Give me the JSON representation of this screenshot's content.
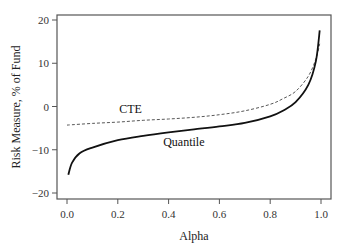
{
  "chart_data": {
    "type": "line",
    "title": "",
    "xlabel": "Alpha",
    "ylabel": "Risk Measure, % of Fund",
    "xlim": [
      0.0,
      1.0
    ],
    "ylim": [
      -20,
      20
    ],
    "xticks": [
      "0.0",
      "0.2",
      "0.4",
      "0.6",
      "0.8",
      "1.0"
    ],
    "yticks": [
      "-20",
      "-10",
      "0",
      "10",
      "20"
    ],
    "grid": false,
    "legend": "inline labels",
    "series": [
      {
        "name": "CTE",
        "style": "dashed",
        "x": [
          0.0,
          0.1,
          0.2,
          0.3,
          0.4,
          0.5,
          0.6,
          0.7,
          0.8,
          0.85,
          0.9,
          0.95,
          0.98,
          0.995
        ],
        "values": [
          -4.3,
          -3.9,
          -3.6,
          -3.2,
          -2.9,
          -2.5,
          -1.9,
          -1.0,
          0.5,
          1.8,
          3.5,
          7.0,
          11.0,
          14.5
        ]
      },
      {
        "name": "Quantile",
        "style": "solid",
        "x": [
          0.005,
          0.02,
          0.05,
          0.1,
          0.2,
          0.3,
          0.4,
          0.5,
          0.6,
          0.7,
          0.8,
          0.85,
          0.9,
          0.95,
          0.98,
          0.995
        ],
        "values": [
          -15.8,
          -13.0,
          -10.8,
          -9.5,
          -7.8,
          -6.8,
          -6.0,
          -5.3,
          -4.6,
          -3.8,
          -2.3,
          -1.0,
          1.0,
          5.0,
          10.5,
          17.6
        ]
      }
    ],
    "annotations": [
      {
        "text": "CTE",
        "x": 0.25,
        "y": -1.6
      },
      {
        "text": "Quantile",
        "x": 0.46,
        "y": -9.2
      }
    ]
  }
}
